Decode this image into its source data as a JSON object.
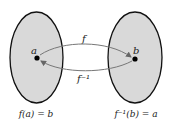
{
  "diagram": {
    "type": "function-inverse mapping",
    "colors": {
      "background": "#ffffff",
      "set_fill": "#d9d9d9",
      "set_stroke": "#111111",
      "arrow": "#777777",
      "point": "#000000",
      "text": "#222222"
    },
    "sets": [
      {
        "id": "domain",
        "point_label": "a",
        "caption": "f(a) = b"
      },
      {
        "id": "codomain",
        "point_label": "b",
        "caption": "f⁻¹(b) = a"
      }
    ],
    "arrows": [
      {
        "id": "forward",
        "label": "f",
        "from": "a",
        "to": "b"
      },
      {
        "id": "inverse",
        "label": "f⁻¹",
        "from": "b",
        "to": "a"
      }
    ]
  }
}
